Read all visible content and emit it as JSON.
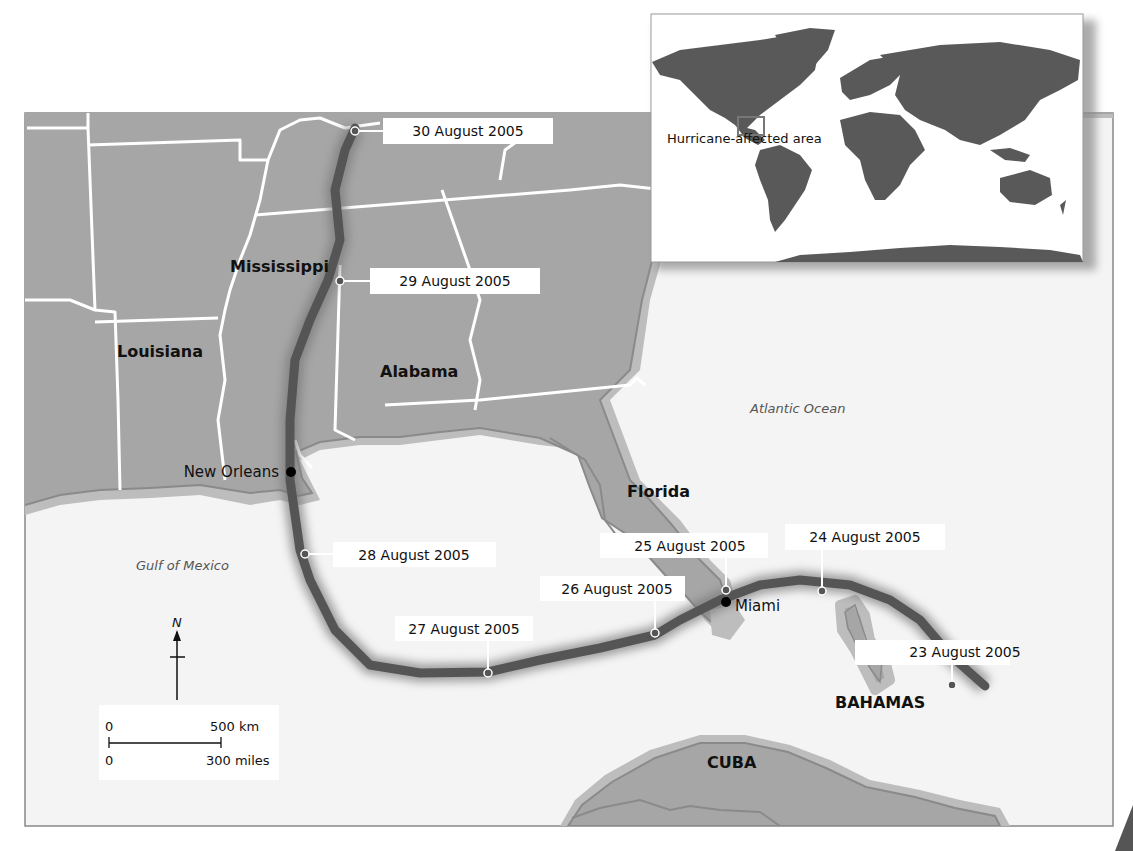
{
  "colors": {
    "land": "#a6a6a6",
    "coast_halo": "#bdbdbd",
    "coast_line": "#8a8a8a",
    "sea": "#f4f4f4",
    "state_border": "#ffffff",
    "track": "#555555",
    "inset_land": "#595959"
  },
  "states": {
    "mississippi": "Mississippi",
    "louisiana": "Louisiana",
    "alabama": "Alabama",
    "florida": "Florida"
  },
  "countries": {
    "bahamas": "BAHAMAS",
    "cuba": "CUBA"
  },
  "cities": {
    "new_orleans": "New Orleans",
    "miami": "Miami"
  },
  "water": {
    "gulf": "Gulf of Mexico",
    "atlantic": "Atlantic Ocean"
  },
  "track_dates": [
    {
      "label": "23 August 2005"
    },
    {
      "label": "24 August 2005"
    },
    {
      "label": "25 August 2005"
    },
    {
      "label": "26 August 2005"
    },
    {
      "label": "27 August 2005"
    },
    {
      "label": "28 August 2005"
    },
    {
      "label": "29 August 2005"
    },
    {
      "label": "30 August 2005"
    }
  ],
  "compass": {
    "north": "N"
  },
  "scale_bar": {
    "km_zero": "0",
    "km_max": "500 km",
    "mi_zero": "0",
    "mi_max": "300 miles"
  },
  "inset": {
    "label": "Hurricane-affected area"
  }
}
